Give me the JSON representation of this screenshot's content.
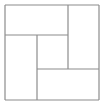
{
  "figure": {
    "background_color": "#ffffff",
    "line_color": "#8c8c8c",
    "line_width": 1.2,
    "canvas": {
      "width": 104,
      "height": 106
    }
  },
  "chart_data": {
    "type": "diagram",
    "xlabel": "",
    "ylabel": "",
    "grid": false,
    "legend": null,
    "xlim": [
      0,
      104
    ],
    "ylim": [
      0,
      106
    ],
    "outer_square": {
      "x1": 5,
      "y1": 5,
      "x2": 99,
      "y2": 100
    },
    "segments": [
      {
        "name": "outer-top",
        "orientation": "horizontal",
        "x1": 5,
        "y1": 5,
        "x2": 99,
        "y2": 5
      },
      {
        "name": "outer-right",
        "orientation": "vertical",
        "x1": 99,
        "y1": 5,
        "x2": 99,
        "y2": 100
      },
      {
        "name": "outer-bottom",
        "orientation": "horizontal",
        "x1": 5,
        "y1": 100,
        "x2": 99,
        "y2": 100
      },
      {
        "name": "outer-left",
        "orientation": "vertical",
        "x1": 5,
        "y1": 5,
        "x2": 5,
        "y2": 100
      },
      {
        "name": "inner-horizontal-upper",
        "orientation": "horizontal",
        "x1": 5,
        "y1": 35,
        "x2": 68,
        "y2": 35
      },
      {
        "name": "inner-vertical-right",
        "orientation": "vertical",
        "x1": 68,
        "y1": 5,
        "x2": 68,
        "y2": 69
      },
      {
        "name": "inner-horizontal-lower",
        "orientation": "horizontal",
        "x1": 37,
        "y1": 69,
        "x2": 99,
        "y2": 69
      },
      {
        "name": "inner-vertical-left",
        "orientation": "vertical",
        "x1": 37,
        "y1": 35,
        "x2": 37,
        "y2": 100
      }
    ],
    "regions": [
      {
        "name": "top-left-rectangle",
        "x1": 5,
        "y1": 5,
        "x2": 68,
        "y2": 35
      },
      {
        "name": "top-right-rectangle",
        "x1": 68,
        "y1": 5,
        "x2": 99,
        "y2": 69
      },
      {
        "name": "bottom-right-rectangle",
        "x1": 37,
        "y1": 69,
        "x2": 99,
        "y2": 100
      },
      {
        "name": "bottom-left-rectangle",
        "x1": 5,
        "y1": 35,
        "x2": 37,
        "y2": 100
      },
      {
        "name": "center-rectangle",
        "x1": 37,
        "y1": 35,
        "x2": 68,
        "y2": 69
      }
    ]
  }
}
